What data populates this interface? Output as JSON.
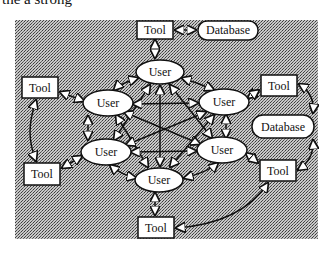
{
  "caption_top_clipped": "the a strong",
  "caption_bottom_clipped": "",
  "diagram": {
    "title": "",
    "colors": {
      "background_hatch_dark": "#5a5a5a",
      "background_hatch_light": "#c8c8c8",
      "node_fill": "#ffffff",
      "stroke": "#111111"
    },
    "nodes": [
      {
        "id": "tool-top",
        "type": "tool",
        "label": "Tool"
      },
      {
        "id": "database-top",
        "type": "database",
        "label": "Database"
      },
      {
        "id": "user-top",
        "type": "user",
        "label": "User"
      },
      {
        "id": "user-left-top",
        "type": "user",
        "label": "User"
      },
      {
        "id": "user-right-top",
        "type": "user",
        "label": "User"
      },
      {
        "id": "user-left-bottom",
        "type": "user",
        "label": "User"
      },
      {
        "id": "user-right-bottom",
        "type": "user",
        "label": "User"
      },
      {
        "id": "user-bottom",
        "type": "user",
        "label": "User"
      },
      {
        "id": "tool-left-top",
        "type": "tool",
        "label": "Tool"
      },
      {
        "id": "tool-left-bottom",
        "type": "tool",
        "label": "Tool"
      },
      {
        "id": "tool-right-top",
        "type": "tool",
        "label": "Tool"
      },
      {
        "id": "database-right",
        "type": "database",
        "label": "Database"
      },
      {
        "id": "tool-right-bottom",
        "type": "tool",
        "label": "Tool"
      },
      {
        "id": "tool-bottom",
        "type": "tool",
        "label": "Tool"
      }
    ],
    "edges": [
      {
        "from": "tool-top",
        "to": "database-top",
        "bidirectional": true
      },
      {
        "from": "tool-top",
        "to": "user-top",
        "bidirectional": true
      },
      {
        "from": "user-left-top",
        "to": "tool-left-top",
        "bidirectional": true
      },
      {
        "from": "tool-left-top",
        "to": "tool-left-bottom",
        "bidirectional": true
      },
      {
        "from": "user-left-bottom",
        "to": "tool-left-bottom",
        "bidirectional": true
      },
      {
        "from": "user-right-top",
        "to": "tool-right-top",
        "bidirectional": true
      },
      {
        "from": "tool-right-top",
        "to": "database-right",
        "bidirectional": true
      },
      {
        "from": "database-right",
        "to": "tool-right-bottom",
        "bidirectional": true
      },
      {
        "from": "user-right-bottom",
        "to": "tool-right-bottom",
        "bidirectional": true
      },
      {
        "from": "user-bottom",
        "to": "tool-bottom",
        "bidirectional": true
      },
      {
        "from": "tool-bottom",
        "to": "tool-right-bottom",
        "bidirectional": true
      },
      {
        "from": "user-top",
        "to": "user-left-top",
        "bidirectional": true
      },
      {
        "from": "user-top",
        "to": "user-right-top",
        "bidirectional": true
      },
      {
        "from": "user-left-top",
        "to": "user-left-bottom",
        "bidirectional": true
      },
      {
        "from": "user-right-top",
        "to": "user-right-bottom",
        "bidirectional": true
      },
      {
        "from": "user-left-bottom",
        "to": "user-bottom",
        "bidirectional": true
      },
      {
        "from": "user-right-bottom",
        "to": "user-bottom",
        "bidirectional": true
      },
      {
        "from": "user-top",
        "to": "user-bottom",
        "bidirectional": true
      },
      {
        "from": "user-top",
        "to": "user-left-bottom",
        "bidirectional": true
      },
      {
        "from": "user-top",
        "to": "user-right-bottom",
        "bidirectional": true
      },
      {
        "from": "user-left-top",
        "to": "user-right-top",
        "bidirectional": true
      },
      {
        "from": "user-left-top",
        "to": "user-right-bottom",
        "bidirectional": true
      },
      {
        "from": "user-left-top",
        "to": "user-bottom",
        "bidirectional": true
      },
      {
        "from": "user-right-top",
        "to": "user-left-bottom",
        "bidirectional": true
      },
      {
        "from": "user-right-top",
        "to": "user-bottom",
        "bidirectional": true
      },
      {
        "from": "user-left-bottom",
        "to": "user-right-bottom",
        "bidirectional": true
      }
    ]
  }
}
